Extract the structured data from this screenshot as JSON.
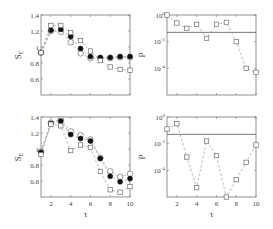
{
  "figure": {
    "width": 273,
    "height": 229,
    "colors": {
      "axis": "#777777",
      "marker": "#555555",
      "filled": "#111111",
      "line": "#888888",
      "threshold": "#555555"
    }
  },
  "chart_data": [
    {
      "id": "top-left",
      "type": "line",
      "title": "",
      "xlabel": "",
      "ylabel": "S_E",
      "xlim": [
        1,
        10
      ],
      "ylim": [
        0.4,
        1.4
      ],
      "yticks": [
        0.6,
        0.8,
        1,
        1.2,
        1.4
      ],
      "ytick_labels": [
        "0.6",
        "0.8",
        "1",
        "1.2",
        "1.4"
      ],
      "xticks": [
        2,
        4,
        6,
        8,
        10
      ],
      "xtick_labels": [],
      "x": [
        1,
        2,
        3,
        4,
        5,
        6,
        7,
        8,
        9,
        10
      ],
      "series": [
        {
          "name": "open-circle",
          "marker": "circle-open",
          "values": [
            0.93,
            1.2,
            1.19,
            1.06,
            0.92,
            0.86,
            0.86,
            0.86,
            0.87,
            0.87
          ]
        },
        {
          "name": "filled-circle",
          "marker": "circle-filled",
          "values": [
            0.93,
            1.21,
            1.22,
            1.13,
            0.98,
            0.88,
            0.87,
            0.87,
            0.88,
            0.88
          ]
        },
        {
          "name": "square",
          "marker": "square-open",
          "values": [
            0.93,
            1.27,
            1.27,
            1.18,
            1.08,
            0.95,
            0.83,
            0.75,
            0.72,
            0.71
          ]
        }
      ]
    },
    {
      "id": "top-right",
      "type": "line",
      "title": "",
      "xlabel": "",
      "ylabel": "P",
      "yscale": "log",
      "xlim": [
        1,
        10
      ],
      "ylim_log10": [
        -6,
        0
      ],
      "yticks_log10": [
        0,
        -2,
        -4
      ],
      "ytick_labels": [
        "10^0",
        "10^-2",
        "10^-4"
      ],
      "xticks": [
        2,
        4,
        6,
        8,
        10
      ],
      "xtick_labels": [],
      "threshold": 0.05,
      "x": [
        1,
        2,
        3,
        4,
        5,
        6,
        7,
        8,
        9,
        10
      ],
      "series": [
        {
          "name": "p-value",
          "marker": "square-open",
          "values_log10": [
            0.0,
            -0.6,
            -1.0,
            -0.7,
            -1.75,
            -0.7,
            -0.55,
            -2.0,
            -4.0,
            -4.3
          ]
        }
      ]
    },
    {
      "id": "bottom-left",
      "type": "line",
      "title": "",
      "xlabel": "τ",
      "ylabel": "S_E",
      "xlim": [
        1,
        10
      ],
      "ylim": [
        0.4,
        1.4
      ],
      "yticks": [
        0.6,
        0.8,
        1,
        1.2,
        1.4
      ],
      "ytick_labels": [
        "0.6",
        "0.8",
        "1",
        "1.2",
        "1.4"
      ],
      "xticks": [
        2,
        4,
        6,
        8,
        10
      ],
      "xtick_labels": [
        "2",
        "4",
        "6",
        "8",
        "10"
      ],
      "x": [
        1,
        2,
        3,
        4,
        5,
        6,
        7,
        8,
        9,
        10
      ],
      "series": [
        {
          "name": "open-circle",
          "marker": "circle-open",
          "values": [
            0.97,
            1.33,
            1.37,
            1.22,
            1.17,
            1.12,
            0.89,
            0.72,
            0.65,
            0.69
          ]
        },
        {
          "name": "filled-circle",
          "marker": "circle-filled",
          "values": [
            0.96,
            1.32,
            1.35,
            1.18,
            1.13,
            1.1,
            0.88,
            0.66,
            0.59,
            0.63
          ]
        },
        {
          "name": "square",
          "marker": "square-open",
          "values": [
            0.93,
            1.31,
            1.29,
            0.98,
            1.05,
            1.02,
            0.72,
            0.49,
            0.46,
            0.53
          ]
        }
      ]
    },
    {
      "id": "bottom-right",
      "type": "line",
      "title": "",
      "xlabel": "τ",
      "ylabel": "P",
      "yscale": "log",
      "xlim": [
        1,
        10
      ],
      "ylim_log10": [
        -6,
        0
      ],
      "yticks_log10": [
        0,
        -2,
        -4
      ],
      "ytick_labels": [
        "10^0",
        "10^-2",
        "10^-4"
      ],
      "xticks": [
        2,
        4,
        6,
        8,
        10
      ],
      "xtick_labels": [
        "2",
        "4",
        "6",
        "8",
        "10"
      ],
      "threshold": 0.05,
      "x": [
        1,
        2,
        3,
        4,
        5,
        6,
        7,
        8,
        9,
        10
      ],
      "series": [
        {
          "name": "p-value",
          "marker": "square-open",
          "values_log10": [
            -0.9,
            -0.5,
            -3.0,
            -5.3,
            -1.8,
            -2.9,
            -6.0,
            -4.7,
            -3.4,
            -2.1
          ]
        }
      ]
    }
  ],
  "layout": {
    "panels": [
      {
        "id": "top-left",
        "x0": 41,
        "x1": 130,
        "y0": 15,
        "y1": 95
      },
      {
        "id": "top-right",
        "x0": 167,
        "x1": 256,
        "y0": 15,
        "y1": 95
      },
      {
        "id": "bottom-left",
        "x0": 41,
        "x1": 130,
        "y0": 117,
        "y1": 197
      },
      {
        "id": "bottom-right",
        "x0": 167,
        "x1": 256,
        "y0": 117,
        "y1": 197
      }
    ]
  }
}
